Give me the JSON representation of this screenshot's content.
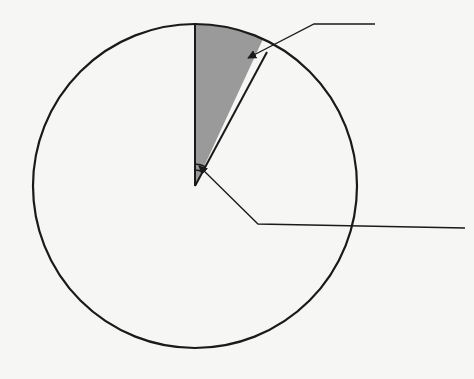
{
  "diagram": {
    "type": "circle-sector",
    "colors": {
      "background": "#f6f6f4",
      "stroke": "#1a1a1a",
      "sector_fill": "#9a9a9a"
    },
    "circle": {
      "cx": 195,
      "cy": 186,
      "r": 162
    },
    "sector": {
      "start_point": [
        195,
        24
      ],
      "end_point": [
        263,
        57
      ],
      "approx_central_angle_deg": 28
    },
    "angle_marks": {
      "count": 2,
      "radii": [
        16,
        20
      ]
    },
    "leaders": [
      {
        "name": "sector-label-leader",
        "points": [
          [
            375,
            24
          ],
          [
            303,
            24
          ],
          [
            245,
            55
          ]
        ],
        "arrow_at_end": true
      },
      {
        "name": "angle-label-leader",
        "points": [
          [
            465,
            228
          ],
          [
            258,
            224
          ],
          [
            197,
            167
          ]
        ],
        "arrow_at_end": true
      }
    ],
    "labels": []
  }
}
